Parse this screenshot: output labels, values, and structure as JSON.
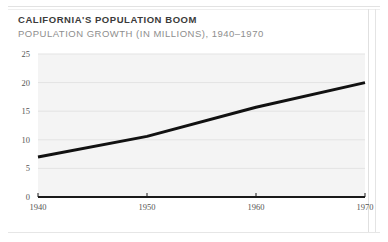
{
  "figure": {
    "title": "CALIFORNIA'S POPULATION BOOM",
    "subtitle": "POPULATION GROWTH (IN MILLIONS), 1940–1970"
  },
  "colors": {
    "title": "#3b3b3b",
    "subtitle": "#8e8e8e",
    "line": "#111111",
    "plot_background": "#f4f4f4",
    "gridline": "#e3e3e3",
    "axis": "#1a1a1a",
    "rule": "#e2e2e2"
  },
  "chart_data": {
    "type": "line",
    "title": "CALIFORNIA'S POPULATION BOOM",
    "subtitle": "POPULATION GROWTH (IN MILLIONS), 1940–1970",
    "xlabel": "",
    "ylabel": "",
    "x": [
      1940,
      1950,
      1960,
      1970
    ],
    "series": [
      {
        "name": "Population (millions)",
        "values": [
          7.0,
          10.6,
          15.7,
          20.0
        ]
      }
    ],
    "xlim": [
      1940,
      1970
    ],
    "ylim": [
      0,
      25
    ],
    "xticks": [
      1940,
      1950,
      1960,
      1970
    ],
    "yticks": [
      0,
      5,
      10,
      15,
      20,
      25
    ],
    "xtick_labels": [
      "1940",
      "1950",
      "1960",
      "1970"
    ],
    "ytick_labels": [
      "0",
      "5",
      "10",
      "15",
      "20",
      "25"
    ],
    "grid": true,
    "grid_axis": "y",
    "legend": false,
    "legend_position": "none",
    "line_width": 3,
    "line_color": "#111111"
  }
}
